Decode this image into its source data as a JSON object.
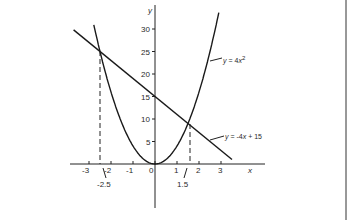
{
  "chart_data": {
    "type": "line",
    "title": "",
    "xlabel": "x",
    "ylabel": "y",
    "xlim": [
      -3.7,
      5
    ],
    "ylim": [
      -10,
      35
    ],
    "grid": false,
    "x_ticks": [
      "-3",
      "-2",
      "-1",
      "0",
      "1",
      "2",
      "3"
    ],
    "y_ticks": [
      "5",
      "10",
      "15",
      "20",
      "25",
      "30"
    ],
    "series": [
      {
        "name": "y = 4x^2",
        "label_main": "y = 4x",
        "label_exp": "2",
        "type": "curve",
        "x": [
          -2.8,
          -2.5,
          -2,
          -1.5,
          -1,
          -0.5,
          0,
          0.5,
          1,
          1.5,
          2,
          2.5,
          2.9
        ],
        "values": [
          31.4,
          25,
          16,
          9,
          4,
          1,
          0,
          1,
          4,
          9,
          16,
          25,
          33.6
        ]
      },
      {
        "name": "y = -4x + 15",
        "label_main": "y = -4x + 15",
        "type": "line",
        "x": [
          -3.7,
          3.5
        ],
        "values": [
          29.8,
          1
        ]
      }
    ],
    "intersections": [
      {
        "x": -2.5,
        "y": 25,
        "label": "-2.5"
      },
      {
        "x": 1.5,
        "y": 9,
        "label": "1.5"
      }
    ],
    "annotations": [
      "-2.5",
      "1.5"
    ]
  }
}
